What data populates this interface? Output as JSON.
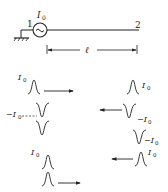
{
  "circuit": {
    "node_left": "1",
    "node_right": "2",
    "source_label": "I",
    "source_sub": "0",
    "length_label": "ℓ",
    "source_symbol": "~"
  },
  "pulses": {
    "left": [
      {
        "label": "I",
        "sub": "0",
        "polarity": "positive",
        "direction": "right"
      },
      {
        "label": "−I",
        "sub": "0",
        "polarity": "negative",
        "direction": "none"
      },
      {
        "label": "I",
        "sub": "0",
        "polarity": "positive",
        "direction": "right"
      }
    ],
    "right": [
      {
        "label": "I",
        "sub": "0",
        "polarity": "positive",
        "direction": "none"
      },
      {
        "label": "−I",
        "sub": "0",
        "polarity": "negative",
        "direction": "left"
      },
      {
        "label": "−I",
        "sub": "0",
        "polarity": "negative",
        "direction": "none"
      },
      {
        "label": "I",
        "sub": "0",
        "polarity": "positive",
        "direction": "left"
      }
    ]
  },
  "colors": {
    "ink": "#222222",
    "background": "#ffffff"
  }
}
